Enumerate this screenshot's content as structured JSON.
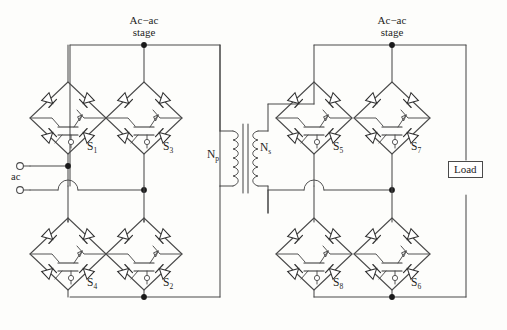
{
  "figure": {
    "type": "circuit-schematic"
  },
  "labels": {
    "stage_left": "Ac−ac\nstage",
    "stage_left_line1": "Ac−ac",
    "stage_left_line2": "stage",
    "stage_right_line1": "Ac−ac",
    "stage_right_line2": "stage",
    "ac_source": "ac",
    "load": "Load",
    "transformer_primary": "N",
    "transformer_primary_sub": "p",
    "transformer_secondary": "N",
    "transformer_secondary_sub": "s"
  },
  "switches": [
    {
      "id": "S1",
      "name": "S",
      "sub": "1",
      "x": 87,
      "y": 140,
      "cell_cx": 68,
      "cell_cy": 118
    },
    {
      "id": "S3",
      "name": "S",
      "sub": "3",
      "x": 163,
      "y": 140,
      "cell_cx": 144,
      "cell_cy": 118
    },
    {
      "id": "S4",
      "name": "S",
      "sub": "4",
      "x": 87,
      "y": 276,
      "cell_cx": 68,
      "cell_cy": 254
    },
    {
      "id": "S2",
      "name": "S",
      "sub": "2",
      "x": 163,
      "y": 276,
      "cell_cx": 144,
      "cell_cy": 254
    },
    {
      "id": "S5",
      "name": "S",
      "sub": "5",
      "x": 333,
      "y": 140,
      "cell_cx": 314,
      "cell_cy": 118
    },
    {
      "id": "S7",
      "name": "S",
      "sub": "7",
      "x": 411,
      "y": 140,
      "cell_cx": 392,
      "cell_cy": 118
    },
    {
      "id": "S8",
      "name": "S",
      "sub": "8",
      "x": 333,
      "y": 276,
      "cell_cx": 314,
      "cell_cy": 254
    },
    {
      "id": "S6",
      "name": "S",
      "sub": "6",
      "x": 411,
      "y": 276,
      "cell_cx": 392,
      "cell_cy": 254
    }
  ],
  "colors": {
    "wire": "#4a4a4a",
    "ink": "#1d1d1d",
    "background": "#fdfdfb",
    "diode_fill": "#ffffff"
  },
  "terminals": {
    "ac_top_x": 20,
    "ac_top_y": 166,
    "ac_bottom_x": 20,
    "ac_bottom_y": 190
  }
}
